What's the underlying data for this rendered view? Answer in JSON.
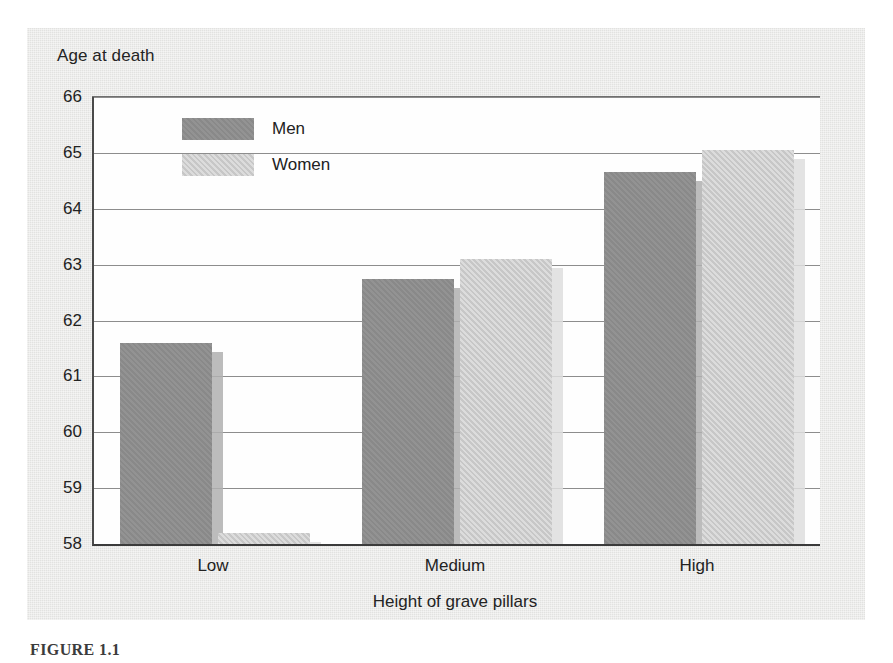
{
  "figure": {
    "caption": "FIGURE 1.1"
  },
  "chart_data": {
    "type": "bar",
    "title": "",
    "ylabel": "Age at death",
    "xlabel": "Height of grave pillars",
    "categories": [
      "Low",
      "Medium",
      "High"
    ],
    "series": [
      {
        "name": "Men",
        "color": "#8e8e8e",
        "values": [
          61.6,
          62.75,
          64.65
        ]
      },
      {
        "name": "Women",
        "color": "#cdcdcd",
        "values": [
          58.2,
          63.1,
          65.05
        ]
      }
    ],
    "ylim": [
      58,
      66
    ],
    "ytick_labels": [
      "66",
      "65",
      "64",
      "63",
      "62",
      "61",
      "60",
      "59",
      "58"
    ],
    "ytick_values": [
      66,
      65,
      64,
      63,
      62,
      61,
      60,
      59,
      58
    ],
    "grid": true,
    "legend_position": "inside-top-left",
    "baseline": 58
  }
}
